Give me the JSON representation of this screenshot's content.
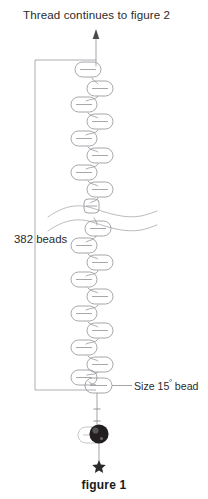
{
  "figure": {
    "caption": "figure 1",
    "top_note": "Thread continues to figure 2",
    "bracket_label": "382 beads",
    "callout_label_main": "Size 15",
    "callout_label_sup": "º",
    "callout_label_tail": " bead",
    "callout_label_full": "Size 15º bead"
  },
  "colors": {
    "background": "#ffffff",
    "ink": "#231f20",
    "thread": "#8d8d92",
    "bead_outline": "#8a8a90",
    "bracket": "#9a9a9f",
    "break_line": "#a9a9ae",
    "dark_bead_fill": "#231f20",
    "arrow": "#4a4a4e",
    "star": "#2b2b2e"
  },
  "diagram": {
    "type": "beading-thread-diagram",
    "thread_axis_x": 96,
    "arrow": {
      "x": 96,
      "y_top": 31,
      "y_bottom": 58,
      "head": "up"
    },
    "bracket": {
      "x_spine": 35,
      "y_top": 60,
      "y_bottom": 390,
      "arm_top_x_end": 96,
      "arm_bottom_x_end": 96
    },
    "break_marks": [
      {
        "y": 211,
        "label": "upper-wave"
      },
      {
        "y": 226,
        "label": "lower-wave"
      }
    ],
    "zigzag_beads": [
      {
        "i": 1,
        "cx": 88,
        "cy": 70,
        "side": "left"
      },
      {
        "i": 2,
        "cx": 100,
        "cy": 89,
        "side": "right"
      },
      {
        "i": 3,
        "cx": 84,
        "cy": 105,
        "side": "left"
      },
      {
        "i": 4,
        "cx": 100,
        "cy": 122,
        "side": "right"
      },
      {
        "i": 5,
        "cx": 84,
        "cy": 139,
        "side": "left"
      },
      {
        "i": 6,
        "cx": 100,
        "cy": 156,
        "side": "right"
      },
      {
        "i": 7,
        "cx": 84,
        "cy": 173,
        "side": "left"
      },
      {
        "i": 8,
        "cx": 100,
        "cy": 190,
        "side": "right"
      },
      {
        "i": 9,
        "cx": 90,
        "cy": 207,
        "side": "center"
      },
      {
        "i": 10,
        "cx": 98,
        "cy": 229,
        "side": "right"
      },
      {
        "i": 11,
        "cx": 84,
        "cy": 246,
        "side": "left"
      },
      {
        "i": 12,
        "cx": 100,
        "cy": 263,
        "side": "right"
      },
      {
        "i": 13,
        "cx": 84,
        "cy": 280,
        "side": "left"
      },
      {
        "i": 14,
        "cx": 100,
        "cy": 297,
        "side": "right"
      },
      {
        "i": 15,
        "cx": 84,
        "cy": 314,
        "side": "left"
      },
      {
        "i": 16,
        "cx": 100,
        "cy": 331,
        "side": "right"
      },
      {
        "i": 17,
        "cx": 84,
        "cy": 348,
        "side": "left"
      },
      {
        "i": 18,
        "cx": 100,
        "cy": 365,
        "side": "right"
      },
      {
        "i": 19,
        "cx": 84,
        "cy": 377,
        "side": "left"
      },
      {
        "i": 20,
        "cx": 98,
        "cy": 385,
        "side": "right"
      }
    ],
    "callout_leader": {
      "x_start": 112,
      "x_end": 132,
      "y": 385
    },
    "dark_bead": {
      "cx": 99,
      "cy": 434,
      "r": 9.5
    },
    "bead_behind_dark": {
      "cx": 94,
      "cy": 436,
      "rx": 13,
      "ry": 7
    },
    "stop_marks": [
      {
        "x": 96,
        "y": 408
      },
      {
        "x": 96,
        "y": 420
      }
    ],
    "star": {
      "cx": 99,
      "cy": 466,
      "size": 6
    },
    "tail_thread": {
      "x": 99,
      "y_top": 444,
      "y_bottom": 461
    }
  }
}
